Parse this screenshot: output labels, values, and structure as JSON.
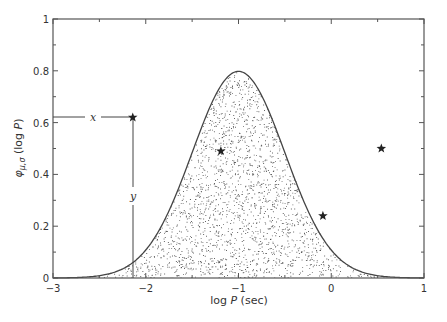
{
  "chart_data": {
    "type": "area",
    "title": "",
    "xlabel": "log P (sec)",
    "ylabel": "φ_{μ,σ} (log P)",
    "xlim": [
      -3,
      1
    ],
    "ylim": [
      0,
      1
    ],
    "x_ticks": [
      -3,
      -2,
      -1,
      0,
      1
    ],
    "x_tick_labels": [
      "−3",
      "−2",
      "−1",
      "0",
      "1"
    ],
    "y_ticks": [
      0,
      0.2,
      0.4,
      0.6,
      0.8,
      1
    ],
    "y_tick_labels": [
      "0",
      "0.2",
      "0.4",
      "0.6",
      "0.8",
      "1"
    ],
    "grid": false,
    "series": [
      {
        "name": "Gaussian density φ_{μ,σ}(log P)",
        "kind": "filled-curve-stippled",
        "mu": -1.0,
        "sigma": 0.5,
        "peak": 0.8
      },
      {
        "name": "star points",
        "kind": "scatter",
        "marker": "star",
        "points": [
          {
            "x": -2.14,
            "y": 0.62
          },
          {
            "x": -1.19,
            "y": 0.49
          },
          {
            "x": -0.09,
            "y": 0.24
          },
          {
            "x": 0.54,
            "y": 0.5
          }
        ]
      }
    ],
    "annotations": [
      {
        "text": "x",
        "type": "horizontal-line",
        "from": [
          -3,
          0.62
        ],
        "to": [
          -2.14,
          0.62
        ]
      },
      {
        "text": "y",
        "type": "vertical-line",
        "from": [
          -2.14,
          0
        ],
        "to": [
          -2.14,
          0.62
        ]
      }
    ]
  },
  "labels": {
    "xlabel_log": "log ",
    "xlabel_P": "P",
    "xlabel_unit": " (sec)",
    "ylabel_phi": "φ",
    "ylabel_sub": "μ,σ",
    "ylabel_paren_open": " (log ",
    "ylabel_P": "P",
    "ylabel_paren_close": ")",
    "annot_x": "x",
    "annot_y": "y"
  }
}
